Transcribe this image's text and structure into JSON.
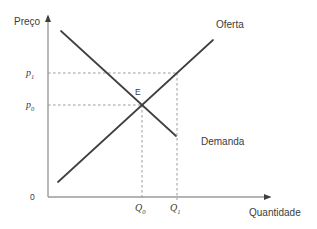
{
  "figure": {
    "kind": "supply-demand-diagram"
  },
  "labels": {
    "y_axis_title": "Preço",
    "x_axis_title": "Quantidade",
    "supply": "Oferta",
    "demand": "Demanda",
    "equilibrium": "E",
    "origin": "0",
    "p1": {
      "base": "p",
      "sub": "1"
    },
    "p0": {
      "base": "p",
      "sub": "0"
    },
    "q0": {
      "base": "Q",
      "sub": "0"
    },
    "q1": {
      "base": "Q",
      "sub": "1"
    }
  },
  "colors": {
    "axis": "#9b9b9b",
    "dashed": "#9b9b9b",
    "curve": "#3f3f3f",
    "text": "#3b3b3b",
    "background": "#ffffff"
  },
  "chart_data": {
    "type": "line",
    "title": "",
    "xlabel": "Quantidade",
    "ylabel": "Preço",
    "axes_qualitative": true,
    "x_tick_labels": [
      "Q₀",
      "Q₁"
    ],
    "y_tick_labels": [
      "p₁",
      "p₀"
    ],
    "legend": "none (curves labeled inline)",
    "series": [
      {
        "name": "Oferta",
        "role": "supply-curve",
        "slope": "positive"
      },
      {
        "name": "Demanda",
        "role": "demand-curve",
        "slope": "negative"
      }
    ],
    "equilibrium": {
      "label": "E",
      "price_label": "p₀",
      "quantity_label": "Q₀"
    },
    "p1_guide_meets": "supply curve at quantity Q₁",
    "lines": [
      {
        "name": "y-axis",
        "class": "axis",
        "x1": 48,
        "y1": 197,
        "x2": 48,
        "y2": 16,
        "arrow": true
      },
      {
        "name": "x-axis",
        "class": "axis",
        "x1": 48,
        "y1": 197,
        "x2": 270,
        "y2": 197,
        "arrow": true
      },
      {
        "name": "p1-dashed-guide",
        "class": "dashed",
        "x1": 48,
        "y1": 73,
        "x2": 177,
        "y2": 73
      },
      {
        "name": "p0-dashed-guide",
        "class": "dashed",
        "x1": 48,
        "y1": 105,
        "x2": 142,
        "y2": 105
      },
      {
        "name": "q0-dashed-guide",
        "class": "dashed",
        "x1": 142,
        "y1": 105,
        "x2": 142,
        "y2": 200
      },
      {
        "name": "q1-dashed-guide",
        "class": "dashed",
        "x1": 177,
        "y1": 73,
        "x2": 177,
        "y2": 200
      },
      {
        "name": "supply-curve",
        "class": "curve",
        "x1": 58,
        "y1": 182,
        "x2": 213,
        "y2": 40
      },
      {
        "name": "demand-curve",
        "class": "curve",
        "x1": 61,
        "y1": 31,
        "x2": 176,
        "y2": 136
      }
    ]
  }
}
